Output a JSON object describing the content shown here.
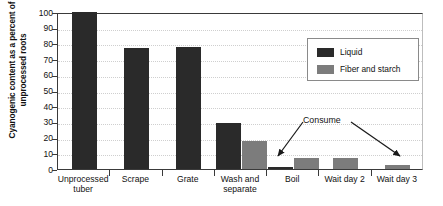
{
  "chart_data": {
    "type": "bar",
    "title": "",
    "xlabel": "",
    "ylabel": "Cyanogenic content as a percent of unprocessed roots",
    "ylim": [
      0,
      100
    ],
    "yticks": [
      0,
      10,
      20,
      30,
      40,
      50,
      60,
      70,
      80,
      90,
      100
    ],
    "grid": true,
    "legend_position": "upper right",
    "categories": [
      "Unprocessed tuber",
      "Scrape",
      "Grate",
      "Wash and separate",
      "Boil",
      "Wait day 2",
      "Wait day 3"
    ],
    "series": [
      {
        "name": "Liquid",
        "color": "#2a2a2a",
        "values": [
          100,
          77,
          78,
          29,
          1,
          0,
          0
        ]
      },
      {
        "name": "Fiber and starch",
        "color": "#7c7c7c",
        "values": [
          0,
          0,
          0,
          18,
          7,
          7,
          2.5
        ]
      }
    ],
    "annotations": [
      {
        "text": "Consume",
        "targets": [
          "Boil",
          "Wait day 3"
        ]
      }
    ]
  },
  "axis": {
    "y_title": "Cyanogenic content as a percent of unprocessed roots",
    "y_tick_labels": [
      "100",
      "90",
      "80",
      "70",
      "60",
      "50",
      "40",
      "30",
      "20",
      "10",
      "0"
    ]
  },
  "legend": {
    "items": [
      {
        "label": "Liquid",
        "color": "#2a2a2a"
      },
      {
        "label": "Fiber and starch",
        "color": "#7c7c7c"
      }
    ]
  },
  "annotation": {
    "label": "Consume"
  },
  "categories": [
    {
      "line1": "Unprocessed",
      "line2": "tuber"
    },
    {
      "line1": "Scrape",
      "line2": ""
    },
    {
      "line1": "Grate",
      "line2": ""
    },
    {
      "line1": "Wash and",
      "line2": "separate"
    },
    {
      "line1": "Boil",
      "line2": ""
    },
    {
      "line1": "Wait day 2",
      "line2": ""
    },
    {
      "line1": "Wait day 3",
      "line2": ""
    }
  ]
}
